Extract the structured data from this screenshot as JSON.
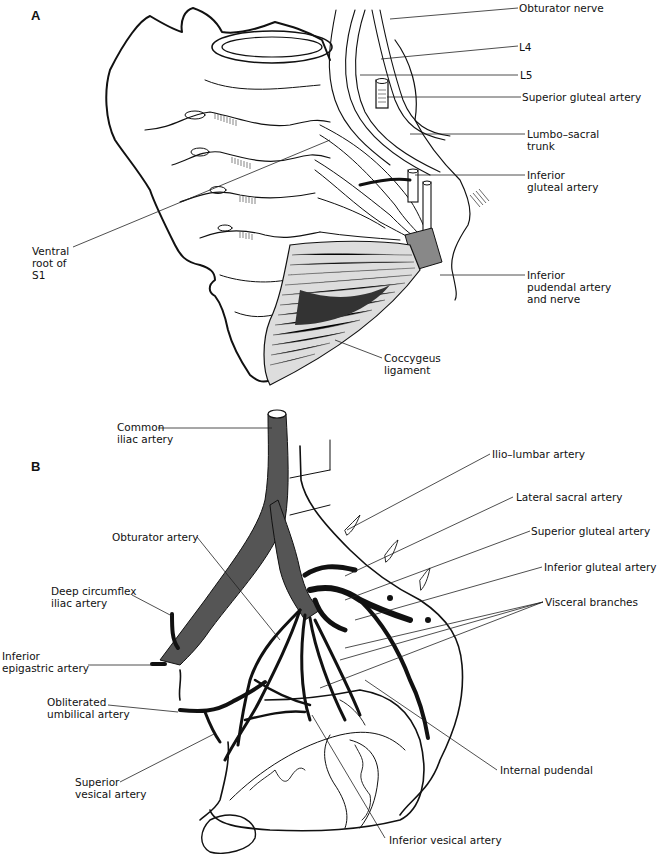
{
  "figure": {
    "panel_a": {
      "letter": "A",
      "labels": [
        {
          "id": "obturator-nerve",
          "text": "Obturator nerve"
        },
        {
          "id": "l4",
          "text": "L4"
        },
        {
          "id": "l5",
          "text": "L5"
        },
        {
          "id": "superior-gluteal-artery",
          "text": "Superior gluteal artery"
        },
        {
          "id": "lumbo-sacral-trunk",
          "text": "Lumbo–sacral\ntrunk"
        },
        {
          "id": "inferior-gluteal-artery",
          "text": "Inferior\ngluteal artery"
        },
        {
          "id": "inferior-pudendal-artery-nerve",
          "text": "Inferior\npudendal artery\nand nerve"
        },
        {
          "id": "coccygeus-ligament",
          "text": "Coccygeus\nligament"
        },
        {
          "id": "ventral-root-s1",
          "text": "Ventral\nroot of\nS1"
        }
      ]
    },
    "panel_b": {
      "letter": "B",
      "labels": [
        {
          "id": "common-iliac-artery",
          "text": "Common\niliac artery"
        },
        {
          "id": "ilio-lumbar-artery",
          "text": "Ilio–lumbar artery"
        },
        {
          "id": "lateral-sacral-artery",
          "text": "Lateral sacral artery"
        },
        {
          "id": "superior-gluteal-artery",
          "text": "Superior gluteal artery"
        },
        {
          "id": "inferior-gluteal-artery",
          "text": "Inferior gluteal artery"
        },
        {
          "id": "visceral-branches",
          "text": "Visceral branches"
        },
        {
          "id": "obturator-artery",
          "text": "Obturator artery"
        },
        {
          "id": "deep-circumflex-iliac-artery",
          "text": "Deep circumflex\niliac artery"
        },
        {
          "id": "inferior-epigastric-artery",
          "text": "Inferior\nepigastric artery"
        },
        {
          "id": "obliterated-umbilical-artery",
          "text": "Obliterated\numbilical artery"
        },
        {
          "id": "superior-vesical-artery",
          "text": "Superior\nvesical artery"
        },
        {
          "id": "internal-pudendal",
          "text": "Internal pudendal"
        },
        {
          "id": "inferior-vesical-artery",
          "text": "Inferior vesical artery"
        }
      ]
    }
  }
}
